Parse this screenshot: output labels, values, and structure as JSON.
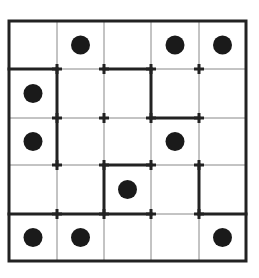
{
  "puzzle": {
    "rows": 5,
    "cols": 5,
    "origin": [
      9,
      21
    ],
    "x_lines": [
      9,
      57,
      104,
      151,
      199,
      246
    ],
    "y_lines": [
      21,
      69,
      118,
      165,
      214,
      261
    ],
    "colors": {
      "line": "#222222",
      "thin": "#888888",
      "dot": "#1a1a1a",
      "background": "#ffffff"
    },
    "dots": [
      [
        0,
        1
      ],
      [
        0,
        3
      ],
      [
        0,
        4
      ],
      [
        1,
        0
      ],
      [
        2,
        0
      ],
      [
        2,
        3
      ],
      [
        3,
        2
      ],
      [
        4,
        0
      ],
      [
        4,
        1
      ],
      [
        4,
        4
      ]
    ],
    "thick_segments": [
      {
        "dir": "h",
        "y": 1,
        "x0": 0,
        "x1": 1
      },
      {
        "dir": "h",
        "y": 1,
        "x0": 2,
        "x1": 3
      },
      {
        "dir": "v",
        "x": 1,
        "y0": 1,
        "y1": 3
      },
      {
        "dir": "v",
        "x": 3,
        "y0": 1,
        "y1": 2
      },
      {
        "dir": "h",
        "y": 2,
        "x0": 3,
        "x1": 4
      },
      {
        "dir": "h",
        "y": 3,
        "x0": 2,
        "x1": 3
      },
      {
        "dir": "v",
        "x": 2,
        "y0": 3,
        "y1": 4
      },
      {
        "dir": "v",
        "x": 4,
        "y0": 3,
        "y1": 4
      },
      {
        "dir": "h",
        "y": 4,
        "x0": 0,
        "x1": 3
      },
      {
        "dir": "h",
        "y": 4,
        "x0": 4,
        "x1": 5
      }
    ]
  }
}
